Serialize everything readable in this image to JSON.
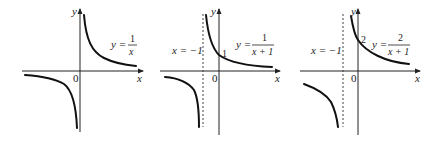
{
  "figure": {
    "panels": [
      {
        "id": "graph-1",
        "function_label": {
          "lhs": "y =",
          "numerator": "1",
          "denominator": "x"
        },
        "axis_labels": {
          "x": "x",
          "y": "y",
          "origin": "0"
        },
        "asymptote_label": null,
        "intercept_label": null
      },
      {
        "id": "graph-2",
        "function_label": {
          "lhs": "y =",
          "numerator": "1",
          "denominator": "x + 1"
        },
        "axis_labels": {
          "x": "x",
          "y": "y",
          "origin": "0"
        },
        "asymptote_label": "x = −1",
        "intercept_label": "1"
      },
      {
        "id": "graph-3",
        "function_label": {
          "lhs": "y =",
          "numerator": "2",
          "denominator": "x + 1"
        },
        "axis_labels": {
          "x": "x",
          "y": "y",
          "origin": "0"
        },
        "asymptote_label": "x = −1",
        "intercept_label": "2"
      }
    ]
  }
}
